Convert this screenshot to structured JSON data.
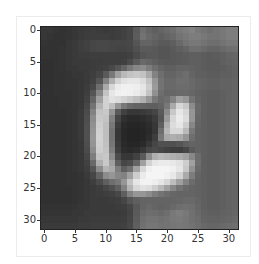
{
  "figure": {
    "type": "grayscale-image-plot",
    "image_size": [
      32,
      32
    ],
    "x_ticks": [
      "0",
      "5",
      "10",
      "15",
      "20",
      "25",
      "30"
    ],
    "y_ticks": [
      "0",
      "5",
      "10",
      "15",
      "20",
      "25",
      "30"
    ],
    "pixels": [
      [
        55,
        55,
        52,
        50,
        52,
        55,
        58,
        60,
        62,
        60,
        58,
        60,
        62,
        65,
        70,
        90,
        110,
        100,
        95,
        100,
        105,
        110,
        120,
        125,
        130,
        120,
        115,
        110,
        115,
        120,
        125,
        125
      ],
      [
        55,
        52,
        50,
        50,
        52,
        55,
        58,
        60,
        62,
        62,
        62,
        60,
        62,
        65,
        70,
        92,
        115,
        105,
        100,
        95,
        100,
        105,
        115,
        120,
        125,
        125,
        120,
        115,
        115,
        120,
        125,
        125
      ],
      [
        52,
        50,
        50,
        50,
        55,
        58,
        62,
        65,
        70,
        72,
        72,
        70,
        70,
        70,
        72,
        85,
        100,
        100,
        95,
        90,
        90,
        95,
        105,
        115,
        120,
        120,
        115,
        110,
        110,
        115,
        120,
        120
      ],
      [
        50,
        50,
        50,
        52,
        55,
        58,
        62,
        65,
        70,
        72,
        72,
        70,
        68,
        68,
        70,
        80,
        90,
        90,
        88,
        85,
        85,
        90,
        95,
        100,
        110,
        110,
        105,
        100,
        100,
        105,
        110,
        112
      ],
      [
        50,
        50,
        50,
        52,
        55,
        58,
        60,
        60,
        62,
        62,
        62,
        62,
        62,
        62,
        65,
        75,
        85,
        88,
        88,
        85,
        85,
        88,
        90,
        92,
        95,
        95,
        92,
        90,
        92,
        95,
        100,
        102
      ],
      [
        48,
        48,
        50,
        52,
        55,
        58,
        58,
        58,
        60,
        60,
        62,
        62,
        62,
        65,
        75,
        90,
        105,
        100,
        95,
        90,
        88,
        88,
        90,
        92,
        95,
        95,
        92,
        90,
        90,
        95,
        98,
        100
      ],
      [
        48,
        48,
        50,
        52,
        55,
        55,
        58,
        58,
        60,
        62,
        65,
        72,
        85,
        100,
        120,
        135,
        140,
        125,
        110,
        100,
        95,
        95,
        100,
        100,
        98,
        95,
        92,
        90,
        90,
        92,
        95,
        98
      ],
      [
        48,
        48,
        50,
        50,
        52,
        55,
        55,
        58,
        62,
        70,
        90,
        120,
        160,
        185,
        195,
        200,
        195,
        170,
        130,
        110,
        100,
        100,
        105,
        110,
        100,
        95,
        95,
        92,
        92,
        95,
        95,
        98
      ],
      [
        48,
        48,
        50,
        50,
        52,
        52,
        55,
        58,
        65,
        85,
        130,
        175,
        210,
        225,
        230,
        230,
        220,
        195,
        150,
        115,
        105,
        105,
        110,
        110,
        105,
        100,
        98,
        95,
        95,
        98,
        98,
        100
      ],
      [
        48,
        48,
        50,
        50,
        52,
        52,
        55,
        60,
        72,
        110,
        170,
        215,
        235,
        240,
        240,
        238,
        230,
        205,
        155,
        115,
        105,
        105,
        108,
        108,
        105,
        100,
        98,
        95,
        95,
        98,
        98,
        100
      ],
      [
        48,
        48,
        50,
        50,
        50,
        52,
        55,
        62,
        85,
        135,
        195,
        230,
        240,
        242,
        240,
        235,
        225,
        195,
        145,
        110,
        102,
        102,
        105,
        105,
        102,
        98,
        95,
        92,
        92,
        95,
        98,
        100
      ],
      [
        48,
        48,
        48,
        50,
        50,
        52,
        55,
        65,
        100,
        160,
        210,
        225,
        220,
        210,
        200,
        190,
        175,
        150,
        120,
        105,
        110,
        130,
        160,
        150,
        115,
        100,
        95,
        92,
        92,
        95,
        98,
        100
      ],
      [
        48,
        48,
        48,
        50,
        50,
        52,
        56,
        70,
        115,
        180,
        210,
        190,
        150,
        120,
        105,
        100,
        98,
        95,
        95,
        100,
        120,
        170,
        215,
        200,
        140,
        105,
        95,
        92,
        92,
        95,
        98,
        100
      ],
      [
        48,
        48,
        48,
        48,
        50,
        52,
        58,
        75,
        130,
        195,
        200,
        150,
        90,
        65,
        55,
        55,
        58,
        62,
        70,
        90,
        140,
        200,
        230,
        215,
        150,
        105,
        95,
        92,
        92,
        95,
        98,
        100
      ],
      [
        48,
        48,
        48,
        48,
        50,
        52,
        58,
        78,
        140,
        200,
        195,
        130,
        70,
        48,
        42,
        42,
        45,
        50,
        60,
        85,
        155,
        215,
        235,
        220,
        150,
        102,
        95,
        92,
        92,
        95,
        98,
        100
      ],
      [
        48,
        48,
        48,
        48,
        50,
        52,
        58,
        80,
        145,
        205,
        190,
        120,
        60,
        42,
        38,
        38,
        40,
        45,
        55,
        95,
        175,
        220,
        230,
        205,
        135,
        100,
        95,
        92,
        92,
        95,
        98,
        100
      ],
      [
        48,
        48,
        48,
        48,
        50,
        52,
        58,
        80,
        148,
        208,
        190,
        115,
        55,
        40,
        36,
        36,
        38,
        42,
        55,
        110,
        185,
        215,
        215,
        185,
        120,
        98,
        95,
        92,
        92,
        95,
        98,
        100
      ],
      [
        48,
        48,
        48,
        48,
        50,
        52,
        58,
        80,
        150,
        210,
        190,
        115,
        55,
        40,
        36,
        36,
        38,
        45,
        62,
        120,
        170,
        175,
        170,
        150,
        110,
        98,
        95,
        92,
        92,
        95,
        98,
        100
      ],
      [
        48,
        48,
        48,
        48,
        50,
        52,
        56,
        78,
        148,
        208,
        192,
        118,
        58,
        42,
        38,
        38,
        42,
        55,
        70,
        80,
        80,
        80,
        85,
        95,
        100,
        98,
        95,
        92,
        92,
        95,
        98,
        100
      ],
      [
        48,
        48,
        48,
        48,
        50,
        52,
        56,
        75,
        140,
        205,
        195,
        125,
        62,
        45,
        42,
        45,
        55,
        70,
        75,
        70,
        65,
        62,
        62,
        70,
        90,
        98,
        95,
        92,
        92,
        95,
        98,
        100
      ],
      [
        48,
        48,
        48,
        48,
        50,
        52,
        55,
        70,
        125,
        195,
        200,
        140,
        75,
        55,
        55,
        65,
        90,
        140,
        175,
        185,
        180,
        175,
        170,
        160,
        135,
        108,
        95,
        92,
        92,
        95,
        98,
        100
      ],
      [
        48,
        48,
        48,
        48,
        50,
        52,
        55,
        65,
        105,
        175,
        200,
        160,
        95,
        70,
        75,
        100,
        160,
        210,
        230,
        235,
        235,
        232,
        225,
        205,
        160,
        110,
        95,
        92,
        92,
        95,
        98,
        100
      ],
      [
        48,
        48,
        48,
        48,
        50,
        52,
        55,
        62,
        85,
        140,
        180,
        170,
        125,
        95,
        110,
        160,
        215,
        240,
        245,
        245,
        245,
        240,
        230,
        200,
        145,
        105,
        95,
        92,
        92,
        95,
        98,
        100
      ],
      [
        48,
        48,
        48,
        48,
        50,
        50,
        52,
        58,
        70,
        100,
        140,
        150,
        135,
        130,
        160,
        205,
        235,
        245,
        245,
        245,
        240,
        232,
        210,
        170,
        125,
        100,
        95,
        92,
        92,
        95,
        98,
        100
      ],
      [
        48,
        48,
        48,
        48,
        50,
        50,
        52,
        55,
        62,
        75,
        95,
        110,
        120,
        150,
        195,
        230,
        242,
        242,
        238,
        230,
        215,
        190,
        160,
        130,
        108,
        98,
        95,
        92,
        92,
        95,
        98,
        100
      ],
      [
        48,
        48,
        48,
        48,
        48,
        50,
        52,
        55,
        58,
        62,
        70,
        80,
        95,
        130,
        180,
        215,
        225,
        220,
        205,
        185,
        160,
        135,
        115,
        105,
        100,
        98,
        95,
        92,
        92,
        95,
        98,
        100
      ],
      [
        48,
        48,
        48,
        48,
        48,
        50,
        52,
        55,
        58,
        60,
        62,
        65,
        72,
        95,
        130,
        150,
        150,
        140,
        125,
        115,
        108,
        102,
        100,
        100,
        100,
        98,
        95,
        92,
        92,
        95,
        98,
        100
      ],
      [
        48,
        48,
        48,
        48,
        48,
        50,
        52,
        55,
        58,
        58,
        58,
        60,
        62,
        70,
        85,
        95,
        100,
        100,
        100,
        100,
        100,
        100,
        102,
        105,
        105,
        100,
        95,
        92,
        92,
        95,
        98,
        100
      ],
      [
        50,
        50,
        50,
        50,
        50,
        52,
        55,
        55,
        58,
        58,
        58,
        58,
        60,
        62,
        70,
        88,
        100,
        105,
        100,
        98,
        100,
        105,
        110,
        112,
        110,
        102,
        95,
        92,
        92,
        95,
        98,
        100
      ],
      [
        52,
        52,
        52,
        52,
        52,
        55,
        55,
        58,
        58,
        58,
        58,
        58,
        58,
        60,
        68,
        90,
        105,
        110,
        108,
        105,
        110,
        120,
        125,
        120,
        112,
        105,
        98,
        95,
        95,
        98,
        100,
        102
      ],
      [
        55,
        55,
        55,
        55,
        55,
        55,
        58,
        58,
        60,
        60,
        60,
        60,
        60,
        62,
        70,
        92,
        110,
        115,
        115,
        112,
        115,
        120,
        122,
        118,
        112,
        108,
        100,
        98,
        98,
        100,
        102,
        105
      ],
      [
        58,
        58,
        58,
        58,
        58,
        58,
        60,
        60,
        62,
        62,
        62,
        62,
        62,
        65,
        72,
        95,
        112,
        118,
        118,
        115,
        115,
        118,
        120,
        118,
        115,
        110,
        105,
        102,
        102,
        105,
        108,
        110
      ]
    ]
  }
}
